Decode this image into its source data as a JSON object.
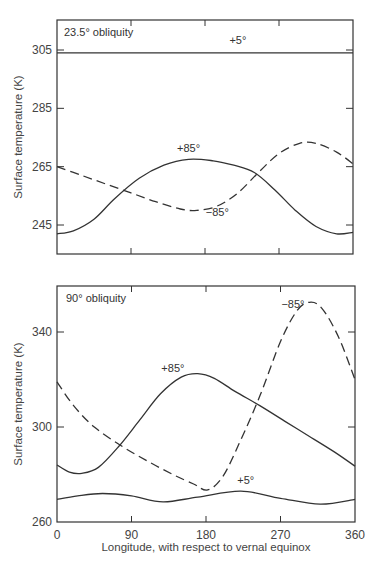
{
  "chart_data": [
    {
      "type": "line",
      "panel": "top",
      "title": "23.5° obliquity",
      "xlabel": "",
      "ylabel": "Surface temperature (K)",
      "xlim": [
        0,
        360
      ],
      "ylim": [
        237,
        312
      ],
      "xticks": [
        0,
        90,
        180,
        270,
        360
      ],
      "xtick_labels_shown": false,
      "yticks": [
        245,
        265,
        285,
        305
      ],
      "grid": false,
      "series": [
        {
          "name": "+5°",
          "style": "solid",
          "x": [
            0,
            90,
            180,
            270,
            360
          ],
          "y": [
            304,
            304,
            304,
            304,
            304
          ]
        },
        {
          "name": "+85°",
          "style": "solid",
          "x": [
            0,
            20,
            45,
            70,
            100,
            130,
            160,
            190,
            215,
            240,
            265,
            290,
            315,
            340,
            360
          ],
          "y": [
            242,
            243,
            247,
            254,
            261,
            265.5,
            267.5,
            267,
            265.5,
            263,
            257,
            250,
            244.5,
            242,
            242.5
          ]
        },
        {
          "name": "−85°",
          "style": "dashed",
          "x": [
            0,
            30,
            60,
            90,
            120,
            150,
            170,
            195,
            220,
            245,
            270,
            295,
            315,
            340,
            360
          ],
          "y": [
            265,
            262,
            259,
            256,
            253,
            250.5,
            250,
            251.5,
            256,
            263,
            269.5,
            273,
            273,
            270,
            266
          ]
        }
      ],
      "annotations": [
        {
          "text": "+5°",
          "x": 220,
          "y": 307
        },
        {
          "text": "+85°",
          "x": 160,
          "y": 270
        },
        {
          "text": "−85°",
          "x": 195,
          "y": 248
        }
      ]
    },
    {
      "type": "line",
      "panel": "bottom",
      "title": "90° obliquity",
      "xlabel": "Longitude, with respect to vernal equinox",
      "ylabel": "Surface temperature (K)",
      "xlim": [
        0,
        360
      ],
      "ylim": [
        260,
        358
      ],
      "xticks": [
        0,
        90,
        180,
        270,
        360
      ],
      "yticks": [
        260,
        300,
        340
      ],
      "grid": false,
      "series": [
        {
          "name": "+5°",
          "style": "solid",
          "x": [
            0,
            25,
            55,
            90,
            128,
            170,
            222,
            270,
            318,
            360
          ],
          "y": [
            269.5,
            271,
            272,
            271,
            268.5,
            270.5,
            273,
            270,
            267.5,
            269.5
          ]
        },
        {
          "name": "+85°",
          "style": "solid",
          "x": [
            0,
            15,
            30,
            50,
            75,
            100,
            125,
            150,
            170,
            190,
            215,
            245,
            275,
            305,
            335,
            360
          ],
          "y": [
            284,
            281,
            280.5,
            283,
            292,
            303,
            314,
            321,
            322.5,
            320.5,
            315,
            309,
            302.5,
            296,
            289.5,
            283.5
          ]
        },
        {
          "name": "−85°",
          "style": "dashed",
          "x": [
            0,
            20,
            45,
            78,
            110,
            140,
            165,
            182,
            200,
            220,
            245,
            270,
            290,
            305,
            320,
            340,
            360
          ],
          "y": [
            319,
            309,
            300,
            292,
            285.5,
            280,
            276,
            273.5,
            279,
            293,
            313,
            336,
            349,
            352.5,
            350,
            338,
            320
          ]
        }
      ],
      "annotations": [
        {
          "text": "+85°",
          "x": 140,
          "y": 323
        },
        {
          "text": "−85°",
          "x": 285,
          "y": 350
        },
        {
          "text": "+5°",
          "x": 228,
          "y": 276
        }
      ]
    }
  ],
  "labels": {
    "top_title": "23.5° obliquity",
    "bottom_title": "90° obliquity",
    "ylabel_top": "Surface temperature (K)",
    "ylabel_bottom": "Surface temperature (K)",
    "xlabel": "Longitude, with respect to vernal equinox"
  },
  "colors": {
    "line": "#333333",
    "frame": "#333333",
    "text": "#444444",
    "background": "#ffffff"
  }
}
